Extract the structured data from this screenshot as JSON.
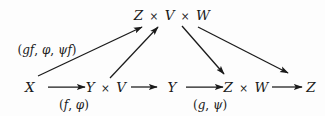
{
  "figure": {
    "kind": "commutative-diagram",
    "background_color": "#fdfdfd",
    "ink_color": "#1a1a1a",
    "width": 325,
    "height": 116
  },
  "nodes": {
    "apex": {
      "label": "Z × V × W",
      "x": 172,
      "y": 16
    },
    "x": {
      "label": "X",
      "x": 30,
      "y": 88
    },
    "yv": {
      "label": "Y × V",
      "x": 106,
      "y": 88
    },
    "y": {
      "label": "Y",
      "x": 172,
      "y": 88
    },
    "zw": {
      "label": "Z × W",
      "x": 246,
      "y": 88
    },
    "z": {
      "label": "Z",
      "x": 311,
      "y": 88
    }
  },
  "edge_labels": {
    "left_diagonal": {
      "label": "(gf, φ, ψf)",
      "x": 47,
      "y": 50
    },
    "bottom_left": {
      "label": "(f, φ)",
      "x": 74,
      "y": 105
    },
    "bottom_right": {
      "label": "(g, ψ)",
      "x": 210,
      "y": 105
    }
  },
  "arrows": [
    {
      "name": "x-to-apex",
      "from": "X",
      "to": "Z × V × W",
      "x1": 38,
      "y1": 76,
      "x2": 142,
      "y2": 27
    },
    {
      "name": "yv-to-apex",
      "from": "Y × V",
      "to": "Z × V × W",
      "x1": 110,
      "y1": 78,
      "x2": 158,
      "y2": 27
    },
    {
      "name": "apex-to-zw",
      "from": "Z × V × W",
      "to": "Z × W",
      "x1": 182,
      "y1": 26,
      "x2": 224,
      "y2": 74
    },
    {
      "name": "apex-to-z",
      "from": "Z × V × W",
      "to": "Z",
      "x1": 198,
      "y1": 27,
      "x2": 288,
      "y2": 73
    },
    {
      "name": "x-to-yv",
      "from": "X",
      "to": "Y × V",
      "x1": 48,
      "y1": 87,
      "x2": 85,
      "y2": 87
    },
    {
      "name": "yv-to-y",
      "from": "Y × V",
      "to": "Y",
      "x1": 131,
      "y1": 87,
      "x2": 157,
      "y2": 87
    },
    {
      "name": "y-to-zw",
      "from": "Y",
      "to": "Z × W",
      "x1": 186,
      "y1": 87,
      "x2": 223,
      "y2": 87
    },
    {
      "name": "zw-to-z",
      "from": "Z × W",
      "to": "Z",
      "x1": 272,
      "y1": 87,
      "x2": 302,
      "y2": 87
    }
  ]
}
